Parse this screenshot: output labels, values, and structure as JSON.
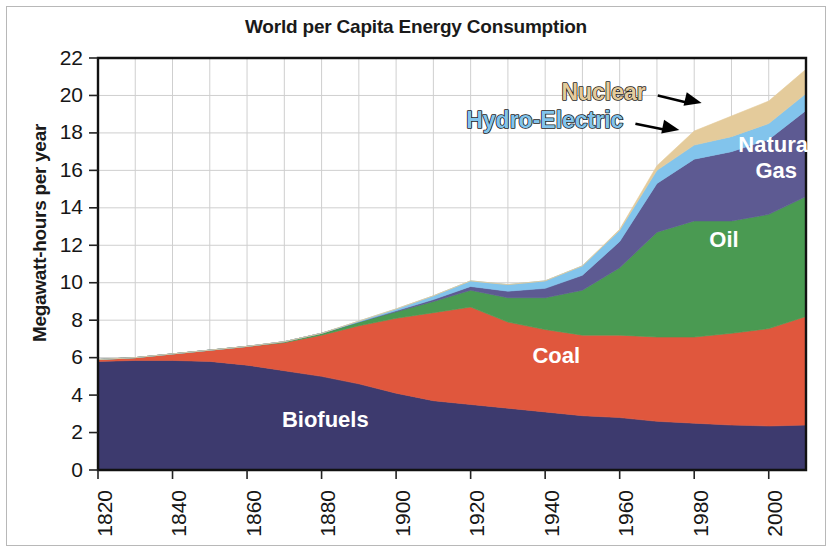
{
  "chart_data": {
    "type": "area",
    "stacked": true,
    "title": "World per Capita Energy Consumption",
    "xlabel": "",
    "ylabel": "Megawatt-hours per year",
    "xlim": [
      1820,
      2010
    ],
    "ylim": [
      0,
      22
    ],
    "ytick_step": 2,
    "xtick_step": 20,
    "grid": true,
    "legend_position": "in-plot-labels",
    "yticks": [
      0,
      2,
      4,
      6,
      8,
      10,
      12,
      14,
      16,
      18,
      20,
      22
    ],
    "xticks": [
      1820,
      1840,
      1860,
      1880,
      1900,
      1920,
      1940,
      1960,
      1980,
      2000
    ],
    "x": [
      1820,
      1830,
      1840,
      1850,
      1860,
      1870,
      1880,
      1890,
      1900,
      1910,
      1920,
      1930,
      1940,
      1950,
      1960,
      1970,
      1980,
      1990,
      2000,
      2010
    ],
    "series": [
      {
        "name": "Biofuels",
        "color": "#3d3a6e",
        "values": [
          5.8,
          5.85,
          5.85,
          5.8,
          5.6,
          5.3,
          5.0,
          4.6,
          4.1,
          3.7,
          3.5,
          3.3,
          3.1,
          2.9,
          2.8,
          2.6,
          2.5,
          2.4,
          2.35,
          2.4
        ]
      },
      {
        "name": "Coal",
        "color": "#e0573d",
        "values": [
          0.1,
          0.15,
          0.35,
          0.6,
          1.0,
          1.5,
          2.2,
          3.1,
          4.0,
          4.7,
          5.2,
          4.6,
          4.4,
          4.3,
          4.4,
          4.5,
          4.6,
          4.9,
          5.2,
          5.8
        ]
      },
      {
        "name": "Oil",
        "color": "#4a9a52",
        "values": [
          0.0,
          0.0,
          0.0,
          0.0,
          0.0,
          0.05,
          0.1,
          0.2,
          0.35,
          0.6,
          0.9,
          1.3,
          1.7,
          2.4,
          3.6,
          5.6,
          6.2,
          6.0,
          6.1,
          6.4
        ]
      },
      {
        "name": "Natural Gas",
        "color": "#5d5a92",
        "values": [
          0.0,
          0.0,
          0.0,
          0.0,
          0.0,
          0.0,
          0.0,
          0.0,
          0.05,
          0.1,
          0.2,
          0.35,
          0.5,
          0.8,
          1.4,
          2.6,
          3.3,
          3.7,
          4.0,
          4.6
        ]
      },
      {
        "name": "Hydro-Electric",
        "color": "#82c4ec",
        "values": [
          0.0,
          0.0,
          0.0,
          0.0,
          0.0,
          0.0,
          0.0,
          0.05,
          0.1,
          0.2,
          0.3,
          0.35,
          0.4,
          0.5,
          0.6,
          0.7,
          0.75,
          0.8,
          0.85,
          0.9
        ]
      },
      {
        "name": "Nuclear",
        "color": "#e4cb9b",
        "values": [
          0.0,
          0.0,
          0.0,
          0.0,
          0.0,
          0.0,
          0.0,
          0.0,
          0.0,
          0.0,
          0.0,
          0.0,
          0.0,
          0.0,
          0.05,
          0.25,
          0.75,
          1.1,
          1.2,
          1.3
        ]
      }
    ],
    "band_labels": [
      {
        "name": "Biofuels",
        "text": "Biofuels",
        "x": 1881,
        "y": 2.6,
        "font_size": 22,
        "color": "#ffffff"
      },
      {
        "name": "Coal",
        "text": "Coal",
        "x": 1943,
        "y": 6.0,
        "font_size": 22,
        "color": "#ffffff"
      },
      {
        "name": "Oil",
        "text": "Oil",
        "x": 1988,
        "y": 12.2,
        "font_size": 22,
        "color": "#ffffff"
      },
      {
        "name": "Natural Gas",
        "text": "Natural",
        "x": 2002,
        "y": 17.3,
        "font_size": 22,
        "color": "#ffffff"
      },
      {
        "name": "Natural Gas",
        "text": "Gas",
        "x": 2002,
        "y": 15.9,
        "font_size": 22,
        "color": "#ffffff"
      }
    ],
    "callouts": [
      {
        "name": "Nuclear",
        "text": "Nuclear",
        "text_color": "#e4cb9b",
        "outline_color": "#1a1a1a",
        "label_x": 1967,
        "label_y": 20.1,
        "arrow_to_x": 1982,
        "arrow_to_y": 19.6,
        "font_size": 23
      },
      {
        "name": "Hydro-Electric",
        "text": "Hydro-Electric",
        "text_color": "#82c4ec",
        "outline_color": "#1a1a1a",
        "label_x": 1961,
        "label_y": 18.6,
        "arrow_to_x": 1976,
        "arrow_to_y": 18.15,
        "font_size": 23
      }
    ]
  },
  "colors": {
    "background": "#ffffff",
    "frame": "#b8b8b8",
    "axis": "#111111",
    "grid": "#cfcfcf",
    "title_text": "#1a1a1a"
  }
}
